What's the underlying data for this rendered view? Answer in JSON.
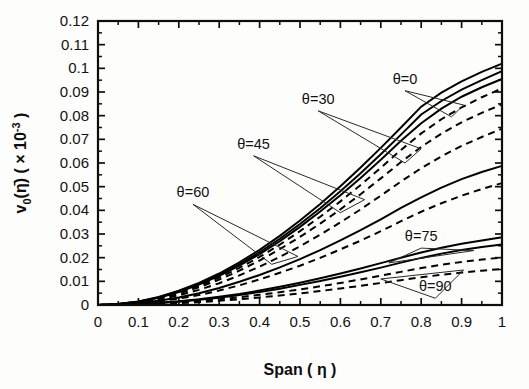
{
  "chart_data": {
    "type": "line",
    "title": "",
    "xlabel": "Span ( η )",
    "ylabel": "v₀( η̄ ) ( × 10⁻³ )",
    "ylabel_parts": {
      "symbol": "v",
      "subscript": "0",
      "argument": "η̄",
      "scale": "( × 10",
      "exponent": "-3",
      "scale_close": " )"
    },
    "xlim": [
      0,
      1
    ],
    "ylim": [
      0,
      0.12
    ],
    "xticks": [
      0,
      0.1,
      0.2,
      0.3,
      0.4,
      0.5,
      0.6,
      0.7,
      0.8,
      0.9,
      1
    ],
    "xticklabels": [
      "0",
      "0.1",
      "0.2",
      "0.3",
      "0.4",
      "0.5",
      "0.6",
      "0.7",
      "0.8",
      "0.9",
      "1"
    ],
    "yticks": [
      0,
      0.01,
      0.02,
      0.03,
      0.04,
      0.05,
      0.06,
      0.07,
      0.08,
      0.09,
      0.1,
      0.11,
      0.12
    ],
    "yticklabels": [
      "0",
      "0.01",
      "0.02",
      "0.03",
      "0.04",
      "0.05",
      "0.06",
      "0.07",
      "0.08",
      "0.09",
      "0.1",
      "0.11",
      "0.12"
    ],
    "grid": false,
    "legend": "none",
    "tick_direction": "in",
    "frame": "box",
    "annotations": [
      {
        "label": "θ=0",
        "x": 0.76,
        "y": 0.0935
      },
      {
        "label": "θ=30",
        "x": 0.545,
        "y": 0.085
      },
      {
        "label": "θ=45",
        "x": 0.385,
        "y": 0.066
      },
      {
        "label": "θ=60",
        "x": 0.235,
        "y": 0.0455
      },
      {
        "label": "θ=75",
        "x": 0.8,
        "y": 0.027
      },
      {
        "label": "θ=90",
        "x": 0.835,
        "y": 0.0058
      }
    ],
    "x": [
      0,
      0.05,
      0.1,
      0.15,
      0.2,
      0.25,
      0.3,
      0.35,
      0.4,
      0.45,
      0.5,
      0.55,
      0.6,
      0.65,
      0.7,
      0.75,
      0.8,
      0.85,
      0.9,
      0.95,
      1.0
    ],
    "series": [
      {
        "name": "θ=0 (a)",
        "style": "solid",
        "values": [
          0,
          0.0004,
          0.0015,
          0.0034,
          0.006,
          0.0093,
          0.0133,
          0.018,
          0.0233,
          0.0292,
          0.0357,
          0.0427,
          0.0502,
          0.0581,
          0.0664,
          0.075,
          0.0838,
          0.0897,
          0.0945,
          0.0985,
          0.102
        ]
      },
      {
        "name": "θ=0 (b)",
        "style": "solid",
        "values": [
          0,
          0.0004,
          0.0014,
          0.0032,
          0.0057,
          0.0089,
          0.0127,
          0.0172,
          0.0223,
          0.028,
          0.0342,
          0.0409,
          0.0481,
          0.0557,
          0.0637,
          0.072,
          0.0805,
          0.0862,
          0.091,
          0.095,
          0.0988
        ]
      },
      {
        "name": "θ=30 (a)",
        "style": "solid",
        "values": [
          0,
          0.0004,
          0.0014,
          0.0031,
          0.0055,
          0.0086,
          0.0123,
          0.0166,
          0.0215,
          0.027,
          0.033,
          0.0395,
          0.0464,
          0.0537,
          0.0614,
          0.0694,
          0.0768,
          0.083,
          0.088,
          0.092,
          0.0955
        ]
      },
      {
        "name": "θ=30 (b)",
        "style": "dashed",
        "values": [
          0,
          0.0004,
          0.0013,
          0.0029,
          0.0052,
          0.0081,
          0.0116,
          0.0157,
          0.0203,
          0.0255,
          0.0312,
          0.0373,
          0.0438,
          0.0507,
          0.058,
          0.0655,
          0.0725,
          0.0785,
          0.0835,
          0.0878,
          0.0915
        ]
      },
      {
        "name": "θ=45 (a)",
        "style": "dashed",
        "values": [
          0,
          0.0003,
          0.0012,
          0.0027,
          0.0048,
          0.0075,
          0.0107,
          0.0145,
          0.0188,
          0.0236,
          0.0288,
          0.0344,
          0.0404,
          0.0468,
          0.0535,
          0.0604,
          0.0668,
          0.0724,
          0.0772,
          0.0812,
          0.0848
        ]
      },
      {
        "name": "θ=45 (b)",
        "style": "dashed",
        "values": [
          0,
          0.0003,
          0.001,
          0.0023,
          0.0041,
          0.0064,
          0.0092,
          0.0125,
          0.0162,
          0.0203,
          0.0248,
          0.0297,
          0.0349,
          0.0404,
          0.0462,
          0.0522,
          0.0578,
          0.0628,
          0.0672,
          0.071,
          0.0745
        ]
      },
      {
        "name": "θ=60 (a)",
        "style": "solid",
        "values": [
          0,
          0.0002,
          0.0008,
          0.0018,
          0.0032,
          0.005,
          0.0072,
          0.0098,
          0.0127,
          0.0159,
          0.0194,
          0.0232,
          0.0273,
          0.0316,
          0.0362,
          0.041,
          0.0455,
          0.0496,
          0.0532,
          0.0562,
          0.0588
        ]
      },
      {
        "name": "θ=60 (b)",
        "style": "dashed",
        "values": [
          0,
          0.0002,
          0.0007,
          0.0015,
          0.0027,
          0.0042,
          0.0061,
          0.0083,
          0.0108,
          0.0136,
          0.0166,
          0.0199,
          0.0235,
          0.0272,
          0.0312,
          0.0354,
          0.0394,
          0.043,
          0.0462,
          0.049,
          0.0515
        ]
      },
      {
        "name": "θ=75 (a)",
        "style": "solid",
        "values": [
          0,
          0.0001,
          0.0004,
          0.0009,
          0.0016,
          0.0024,
          0.0035,
          0.0047,
          0.0061,
          0.0077,
          0.0094,
          0.0113,
          0.0133,
          0.0154,
          0.0177,
          0.02,
          0.0222,
          0.0242,
          0.0259,
          0.0273,
          0.0286
        ]
      },
      {
        "name": "θ=75 (b)",
        "style": "solid",
        "values": [
          0,
          0.0001,
          0.0004,
          0.0008,
          0.0014,
          0.0022,
          0.0031,
          0.0042,
          0.0055,
          0.0069,
          0.0085,
          0.0101,
          0.0119,
          0.0138,
          0.0158,
          0.0179,
          0.0199,
          0.0217,
          0.0232,
          0.0245,
          0.0256
        ]
      },
      {
        "name": "θ=90 (a)",
        "style": "dashed",
        "values": [
          0,
          0.0001,
          0.0003,
          0.0006,
          0.0011,
          0.0017,
          0.0024,
          0.0033,
          0.0043,
          0.0054,
          0.0066,
          0.0079,
          0.0093,
          0.0108,
          0.0124,
          0.014,
          0.0156,
          0.017,
          0.0182,
          0.0192,
          0.0201
        ]
      },
      {
        "name": "θ=90 (b)",
        "style": "dashed",
        "values": [
          0,
          0.0,
          0.0002,
          0.0004,
          0.0008,
          0.0012,
          0.0018,
          0.0024,
          0.0032,
          0.004,
          0.0049,
          0.0059,
          0.007,
          0.0081,
          0.0093,
          0.0105,
          0.0117,
          0.0128,
          0.0137,
          0.0145,
          0.0152
        ]
      }
    ]
  },
  "plot_geometry": {
    "left": 98,
    "right": 502,
    "top": 21,
    "bottom": 305
  }
}
